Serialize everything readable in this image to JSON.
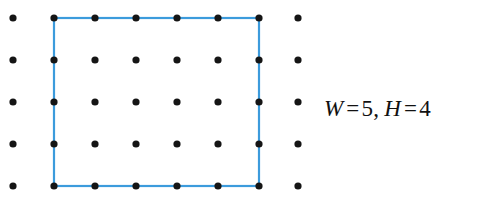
{
  "figure": {
    "title_semantic": "lattice-grid-with-rectangle",
    "background_color": "#ffffff",
    "dot_color": "#151515",
    "dot_radius": 3.6,
    "rect_color": "#3c9bdc",
    "rect_stroke_width": 2.2,
    "grid": {
      "columns": 8,
      "rows": 5,
      "x_positions": [
        13,
        54,
        95,
        136,
        177,
        218,
        259,
        298
      ],
      "y_positions": [
        18,
        60,
        102,
        144,
        186
      ]
    },
    "rectangle": {
      "x": 54,
      "y": 18,
      "width": 205,
      "height": 168,
      "spans_columns": [
        2,
        7
      ],
      "spans_rows": [
        1,
        5
      ]
    }
  },
  "label": {
    "full_text": "W = 5, H = 4",
    "width_var": "W",
    "width_op": "=",
    "width_value": "5",
    "separator": ",",
    "height_var": "H",
    "height_op": "=",
    "height_value": "4"
  }
}
